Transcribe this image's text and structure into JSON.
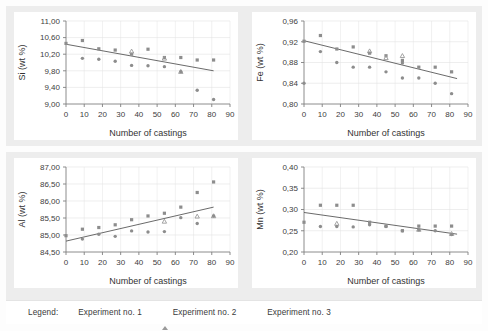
{
  "figure": {
    "background": "#fdfdfd",
    "panel_band_color": "#ededed",
    "marker_color": "#8d8d8d",
    "trend_color": "#595959",
    "axis_color": "#7f7f7f",
    "grid_color": "#e2e2e2"
  },
  "legend": {
    "title": "Legend:",
    "items": [
      {
        "label": "Experiment no. 1",
        "marker": "square-marker-icon"
      },
      {
        "label": "Experiment no. 2",
        "marker": "triangle-marker-icon"
      },
      {
        "label": "Experiment no. 3",
        "marker": "circle-marker-icon"
      }
    ]
  },
  "chart_data": [
    {
      "id": "si",
      "type": "scatter",
      "title": "",
      "xlabel": "Number of castings",
      "ylabel": "Si (wt %)",
      "xlim": [
        0,
        90
      ],
      "ylim": [
        9.0,
        11.0
      ],
      "xticks": [
        0,
        10,
        20,
        30,
        40,
        50,
        60,
        70,
        80,
        90
      ],
      "xticklabels": [
        "0",
        "10",
        "20",
        "30",
        "40",
        "50",
        "60",
        "70",
        "80",
        "90"
      ],
      "yticks": [
        9.0,
        9.4,
        9.8,
        10.2,
        10.6,
        11.0
      ],
      "yticklabels": [
        "9,00",
        "9,40",
        "9,80",
        "10,20",
        "10,60",
        "11,00"
      ],
      "grid": true,
      "legend_position": "external-bottom",
      "series": [
        {
          "name": "Experiment no. 1",
          "marker": "square",
          "points": [
            [
              0,
              10.46
            ],
            [
              9,
              10.53
            ],
            [
              18,
              10.33
            ],
            [
              27,
              10.3
            ],
            [
              36,
              10.2
            ],
            [
              45,
              10.32
            ],
            [
              54,
              10.12
            ],
            [
              63,
              10.12
            ],
            [
              72,
              10.06
            ],
            [
              81,
              10.06
            ]
          ]
        },
        {
          "name": "Experiment no. 2",
          "marker": "triangle",
          "points": [
            [
              36,
              10.27
            ],
            [
              54,
              10.1
            ],
            [
              63,
              9.78
            ]
          ]
        },
        {
          "name": "Experiment no. 3",
          "marker": "circle",
          "points": [
            [
              9,
              10.1
            ],
            [
              18,
              10.08
            ],
            [
              27,
              10.03
            ],
            [
              36,
              9.93
            ],
            [
              45,
              9.92
            ],
            [
              54,
              9.9
            ],
            [
              63,
              9.78
            ],
            [
              72,
              9.33
            ],
            [
              81,
              9.11
            ]
          ]
        }
      ],
      "trendline": {
        "x": [
          0,
          81
        ],
        "y": [
          10.44,
          9.8
        ]
      }
    },
    {
      "id": "fe",
      "type": "scatter",
      "title": "",
      "xlabel": "Number of castings",
      "ylabel": "Fe (wt %)",
      "xlim": [
        0,
        90
      ],
      "ylim": [
        0.8,
        0.96
      ],
      "xticks": [
        0,
        10,
        20,
        30,
        40,
        50,
        60,
        70,
        80,
        90
      ],
      "xticklabels": [
        "0",
        "10",
        "20",
        "30",
        "40",
        "50",
        "60",
        "70",
        "80",
        "90"
      ],
      "yticks": [
        0.8,
        0.84,
        0.88,
        0.92,
        0.96
      ],
      "yticklabels": [
        "0,80",
        "0,84",
        "0,88",
        "0,92",
        "0,96"
      ],
      "grid": true,
      "legend_position": "external-bottom",
      "series": [
        {
          "name": "Experiment no. 1",
          "marker": "square",
          "points": [
            [
              0,
              0.921
            ],
            [
              9,
              0.932
            ],
            [
              18,
              0.906
            ],
            [
              27,
              0.91
            ],
            [
              36,
              0.898
            ],
            [
              45,
              0.893
            ],
            [
              54,
              0.884
            ],
            [
              63,
              0.871
            ],
            [
              72,
              0.871
            ],
            [
              81,
              0.862
            ]
          ]
        },
        {
          "name": "Experiment no. 2",
          "marker": "triangle",
          "points": [
            [
              36,
              0.902
            ],
            [
              54,
              0.893
            ],
            [
              45,
              0.889
            ]
          ]
        },
        {
          "name": "Experiment no. 3",
          "marker": "circle",
          "points": [
            [
              0,
              0.84
            ],
            [
              9,
              0.901
            ],
            [
              18,
              0.88
            ],
            [
              27,
              0.871
            ],
            [
              36,
              0.871
            ],
            [
              45,
              0.862
            ],
            [
              54,
              0.879
            ],
            [
              54,
              0.85
            ],
            [
              63,
              0.85
            ],
            [
              72,
              0.84
            ],
            [
              81,
              0.82
            ]
          ]
        }
      ],
      "trendline": {
        "x": [
          0,
          84
        ],
        "y": [
          0.922,
          0.849
        ]
      }
    },
    {
      "id": "al",
      "type": "scatter",
      "title": "",
      "xlabel": "Number of castings",
      "ylabel": "Al (wt %)",
      "xlim": [
        0,
        90
      ],
      "ylim": [
        84.5,
        87.0
      ],
      "xticks": [
        0,
        10,
        20,
        30,
        40,
        50,
        60,
        70,
        80,
        90
      ],
      "xticklabels": [
        "0",
        "10",
        "20",
        "30",
        "40",
        "50",
        "60",
        "70",
        "80",
        "90"
      ],
      "yticks": [
        84.5,
        85.0,
        85.5,
        86.0,
        86.5,
        87.0
      ],
      "yticklabels": [
        "84,50",
        "85,00",
        "85,50",
        "86,00",
        "86,50",
        "87,00"
      ],
      "grid": true,
      "legend_position": "external-bottom",
      "series": [
        {
          "name": "Experiment no. 1",
          "marker": "square",
          "points": [
            [
              0,
              84.98
            ],
            [
              9,
              85.17
            ],
            [
              18,
              85.22
            ],
            [
              27,
              85.3
            ],
            [
              36,
              85.45
            ],
            [
              45,
              85.56
            ],
            [
              54,
              85.64
            ],
            [
              63,
              85.82
            ],
            [
              72,
              86.25
            ],
            [
              81,
              86.56
            ]
          ]
        },
        {
          "name": "Experiment no. 2",
          "marker": "triangle",
          "points": [
            [
              54,
              85.4
            ],
            [
              72,
              85.55
            ],
            [
              81,
              85.56
            ]
          ]
        },
        {
          "name": "Experiment no. 3",
          "marker": "circle",
          "points": [
            [
              9,
              84.88
            ],
            [
              18,
              85.02
            ],
            [
              27,
              84.96
            ],
            [
              36,
              85.12
            ],
            [
              45,
              85.09
            ],
            [
              54,
              85.1
            ],
            [
              63,
              85.51
            ],
            [
              72,
              85.34
            ],
            [
              81,
              85.56
            ]
          ]
        }
      ],
      "trendline": {
        "x": [
          0,
          81
        ],
        "y": [
          84.82,
          85.82
        ]
      }
    },
    {
      "id": "mn",
      "type": "scatter",
      "title": "",
      "xlabel": "Number of castings",
      "ylabel": "Mn (wt %)",
      "xlim": [
        0,
        90
      ],
      "ylim": [
        0.2,
        0.4
      ],
      "xticks": [
        0,
        10,
        20,
        30,
        40,
        50,
        60,
        70,
        80,
        90
      ],
      "xticklabels": [
        "0",
        "10",
        "20",
        "30",
        "40",
        "50",
        "60",
        "70",
        "80",
        "90"
      ],
      "yticks": [
        0.2,
        0.25,
        0.3,
        0.35,
        0.4
      ],
      "yticklabels": [
        "0,20",
        "0,25",
        "0,30",
        "0,35",
        "0,40"
      ],
      "grid": true,
      "legend_position": "external-bottom",
      "series": [
        {
          "name": "Experiment no. 1",
          "marker": "square",
          "points": [
            [
              0,
              0.27
            ],
            [
              9,
              0.31
            ],
            [
              18,
              0.31
            ],
            [
              27,
              0.31
            ],
            [
              36,
              0.27
            ],
            [
              45,
              0.261
            ],
            [
              54,
              0.25
            ],
            [
              63,
              0.261
            ],
            [
              72,
              0.261
            ],
            [
              81,
              0.261
            ]
          ]
        },
        {
          "name": "Experiment no. 2",
          "marker": "triangle",
          "points": [
            [
              18,
              0.267
            ],
            [
              63,
              0.253
            ],
            [
              81,
              0.243
            ]
          ]
        },
        {
          "name": "Experiment no. 3",
          "marker": "circle",
          "points": [
            [
              9,
              0.26
            ],
            [
              18,
              0.26
            ],
            [
              27,
              0.259
            ],
            [
              36,
              0.264
            ],
            [
              45,
              0.26
            ],
            [
              54,
              0.25
            ],
            [
              63,
              0.252
            ],
            [
              72,
              0.25
            ],
            [
              81,
              0.241
            ]
          ]
        }
      ],
      "trendline": {
        "x": [
          0,
          84
        ],
        "y": [
          0.293,
          0.242
        ]
      }
    }
  ]
}
